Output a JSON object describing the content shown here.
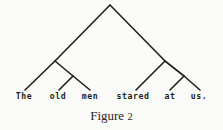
{
  "figure": {
    "caption_label": "Figure",
    "caption_number": "2",
    "background_color": "#fbfbfa",
    "ink_color": "#231f1e"
  },
  "chart_data": {
    "type": "diagram",
    "diagram_kind": "syntax-tree",
    "title": "Figure 2",
    "sentence": "The old men stared at us.",
    "leaves": [
      {
        "id": "leaf-the",
        "label": "The",
        "x": 24,
        "y": 99
      },
      {
        "id": "leaf-old",
        "label": "old",
        "x": 58,
        "y": 99
      },
      {
        "id": "leaf-men",
        "label": "men",
        "x": 90,
        "y": 99
      },
      {
        "id": "leaf-stared",
        "label": "stared",
        "x": 133,
        "y": 99
      },
      {
        "id": "leaf-at",
        "label": "at",
        "x": 170,
        "y": 99
      },
      {
        "id": "leaf-us",
        "label": "us.",
        "x": 199,
        "y": 99
      }
    ],
    "nodes": [
      {
        "id": "root",
        "x": 110,
        "y": 5
      },
      {
        "id": "left-node",
        "x": 55,
        "y": 61
      },
      {
        "id": "right-node",
        "x": 165,
        "y": 61
      },
      {
        "id": "left-sub",
        "x": 73,
        "y": 76
      },
      {
        "id": "right-sub",
        "x": 184,
        "y": 76
      }
    ],
    "edges": [
      {
        "from": "root",
        "to": "left-node",
        "x1": 110,
        "y1": 5,
        "x2": 55,
        "y2": 61
      },
      {
        "from": "root",
        "to": "right-node",
        "x1": 110,
        "y1": 5,
        "x2": 165,
        "y2": 61
      },
      {
        "from": "left-node",
        "to": "leaf-the",
        "x1": 55,
        "y1": 61,
        "x2": 25,
        "y2": 90
      },
      {
        "from": "left-node",
        "to": "left-sub",
        "x1": 55,
        "y1": 61,
        "x2": 73,
        "y2": 76
      },
      {
        "from": "left-sub",
        "to": "leaf-old",
        "x1": 73,
        "y1": 76,
        "x2": 59,
        "y2": 90
      },
      {
        "from": "left-sub",
        "to": "leaf-men",
        "x1": 73,
        "y1": 76,
        "x2": 90,
        "y2": 90
      },
      {
        "from": "right-node",
        "to": "leaf-stared",
        "x1": 165,
        "y1": 61,
        "x2": 136,
        "y2": 90
      },
      {
        "from": "right-node",
        "to": "right-sub",
        "x1": 165,
        "y1": 61,
        "x2": 184,
        "y2": 76
      },
      {
        "from": "right-sub",
        "to": "leaf-at",
        "x1": 184,
        "y1": 76,
        "x2": 170,
        "y2": 90
      },
      {
        "from": "right-sub",
        "to": "leaf-us",
        "x1": 184,
        "y1": 76,
        "x2": 200,
        "y2": 90
      }
    ],
    "line_color": "#231f1e",
    "line_width": 1.6
  }
}
